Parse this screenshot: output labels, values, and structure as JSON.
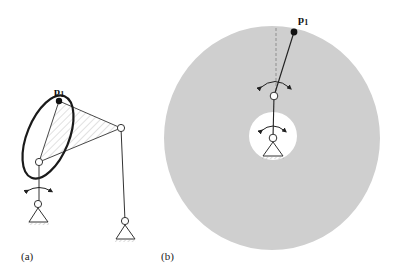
{
  "panels": [
    {
      "id": "a",
      "caption": "(a)",
      "point_label": "p",
      "point_subscript": "1",
      "description": "Four-bar linkage with coupler triangle; coupler point p1 traces an elliptical curve"
    },
    {
      "id": "b",
      "caption": "(b)",
      "point_label": "p",
      "point_subscript": "1",
      "description": "Two-link serial arm; grey annular workspace reachable by point p1"
    }
  ],
  "colors": {
    "ink": "#222222",
    "workspace_fill": "#cfcfcf",
    "hatch": "#bbbbbb",
    "background": "#ffffff"
  }
}
